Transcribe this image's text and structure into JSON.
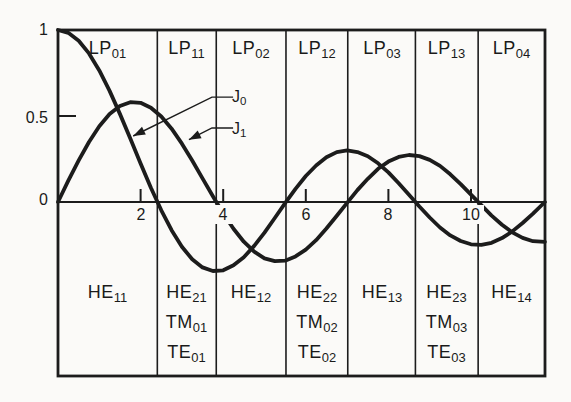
{
  "chart_data": {
    "type": "line",
    "grid": false,
    "xlim": [
      0,
      11.79
    ],
    "ylim": [
      -1.01,
      1.0
    ],
    "x": [
      0,
      0.25,
      0.5,
      0.75,
      1,
      1.25,
      1.5,
      1.75,
      2,
      2.25,
      2.5,
      2.75,
      3,
      3.25,
      3.5,
      3.75,
      4,
      4.25,
      4.5,
      4.75,
      5,
      5.25,
      5.5,
      5.75,
      6,
      6.25,
      6.5,
      6.75,
      7,
      7.25,
      7.5,
      7.75,
      8,
      8.25,
      8.5,
      8.75,
      9,
      9.25,
      9.5,
      9.75,
      10,
      10.25,
      10.5,
      10.75,
      11,
      11.25,
      11.5,
      11.79
    ],
    "series": [
      {
        "name": "J0",
        "label_main": "J",
        "label_sub": "0",
        "values": [
          1,
          0.984,
          0.938,
          0.864,
          0.765,
          0.646,
          0.512,
          0.369,
          0.224,
          0.083,
          -0.048,
          -0.164,
          -0.26,
          -0.333,
          -0.38,
          -0.401,
          -0.397,
          -0.368,
          -0.321,
          -0.255,
          -0.178,
          -0.093,
          -0.007,
          0.076,
          0.151,
          0.212,
          0.26,
          0.29,
          0.3,
          0.29,
          0.266,
          0.225,
          0.172,
          0.109,
          0.042,
          -0.026,
          -0.09,
          -0.148,
          -0.194,
          -0.227,
          -0.246,
          -0.249,
          -0.237,
          -0.21,
          -0.171,
          -0.122,
          -0.068,
          0
        ]
      },
      {
        "name": "J1",
        "label_main": "J",
        "label_sub": "1",
        "values": [
          0,
          0.124,
          0.242,
          0.349,
          0.44,
          0.511,
          0.558,
          0.58,
          0.577,
          0.548,
          0.497,
          0.426,
          0.339,
          0.241,
          0.137,
          0.033,
          -0.066,
          -0.156,
          -0.231,
          -0.289,
          -0.328,
          -0.344,
          -0.341,
          -0.316,
          -0.277,
          -0.222,
          -0.154,
          -0.08,
          -0.005,
          0.069,
          0.135,
          0.193,
          0.235,
          0.262,
          0.273,
          0.267,
          0.245,
          0.21,
          0.161,
          0.104,
          0.043,
          -0.018,
          -0.079,
          -0.132,
          -0.177,
          -0.209,
          -0.228,
          -0.232
        ]
      }
    ],
    "x_ticks": [
      2,
      4,
      6,
      8,
      10
    ],
    "y_ticks": [
      {
        "label": "1",
        "value": 1
      },
      {
        "label": "0.5",
        "value": 0.5
      },
      {
        "label": "0",
        "value": 0
      }
    ],
    "region_boundaries": [
      2.405,
      3.832,
      5.52,
      7.016,
      8.654,
      10.173
    ],
    "lp_regions": [
      {
        "main": "LP",
        "sub": "01"
      },
      {
        "main": "LP",
        "sub": "11"
      },
      {
        "main": "LP",
        "sub": "02"
      },
      {
        "main": "LP",
        "sub": "12"
      },
      {
        "main": "LP",
        "sub": "03"
      },
      {
        "main": "LP",
        "sub": "13"
      },
      {
        "main": "LP",
        "sub": "04"
      }
    ],
    "mode_regions": [
      [
        {
          "main": "HE",
          "sub": "11"
        }
      ],
      [
        {
          "main": "HE",
          "sub": "21"
        },
        {
          "main": "TM",
          "sub": "01"
        },
        {
          "main": "TE",
          "sub": "01"
        }
      ],
      [
        {
          "main": "HE",
          "sub": "12"
        }
      ],
      [
        {
          "main": "HE",
          "sub": "22"
        },
        {
          "main": "TM",
          "sub": "02"
        },
        {
          "main": "TE",
          "sub": "02"
        }
      ],
      [
        {
          "main": "HE",
          "sub": "13"
        }
      ],
      [
        {
          "main": "HE",
          "sub": "23"
        },
        {
          "main": "TM",
          "sub": "03"
        },
        {
          "main": "TE",
          "sub": "03"
        }
      ],
      [
        {
          "main": "HE",
          "sub": "14"
        }
      ]
    ],
    "annotations": [
      {
        "target": "J0",
        "path": [
          [
            4.24,
            0.61
          ],
          [
            3.73,
            0.61
          ],
          [
            1.82,
            0.384
          ]
        ]
      },
      {
        "target": "J1",
        "path": [
          [
            4.24,
            0.43
          ],
          [
            3.73,
            0.43
          ],
          [
            3.17,
            0.362
          ]
        ]
      }
    ],
    "ink_color": "#1c1c1c",
    "background_color": "#fbfaf8"
  }
}
